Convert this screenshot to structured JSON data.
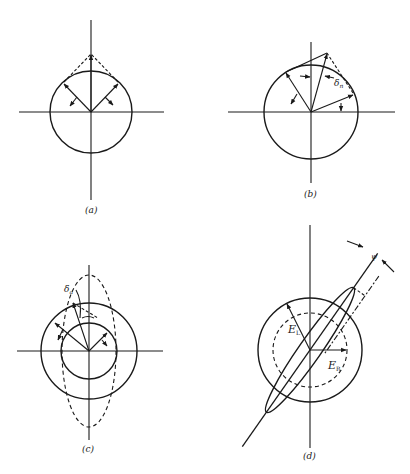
{
  "figure": {
    "panels": [
      {
        "id": "a",
        "caption": "(a)"
      },
      {
        "id": "b",
        "caption": "(b)",
        "annotation": "δ",
        "annotation_sub": "n"
      },
      {
        "id": "c",
        "caption": "(c)",
        "annotation": "δ",
        "annotation_sub": "a"
      },
      {
        "id": "d",
        "caption": "(d)",
        "label_left": "E",
        "label_left_sub": "L",
        "label_right": "E",
        "label_right_sub": "R",
        "angle": "ψ"
      }
    ],
    "colors": {
      "ink": "#1a1a1a",
      "background": "#ffffff"
    }
  }
}
